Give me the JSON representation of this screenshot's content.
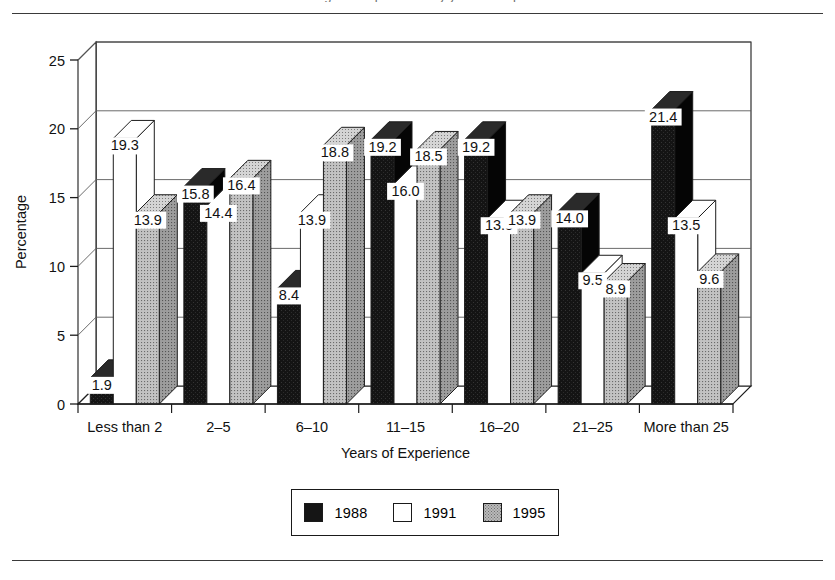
{
  "page": {
    "title_fragment": "Percentage of respondents by years of experience"
  },
  "legend": {
    "items": [
      {
        "label": "1988",
        "swatch": "black-swatch"
      },
      {
        "label": "1991",
        "swatch": "white-swatch"
      },
      {
        "label": "1995",
        "swatch": "stippled-gray-swatch"
      }
    ]
  },
  "chart_data": {
    "type": "bar",
    "title": "",
    "xlabel": "Years of Experience",
    "ylabel": "Percentage",
    "ylim": [
      0,
      25
    ],
    "yticks": [
      0,
      5,
      10,
      15,
      20,
      25
    ],
    "grid": true,
    "legend_position": "bottom",
    "three_d": true,
    "categories": [
      "Less than 2",
      "2–5",
      "6–10",
      "11–15",
      "16–20",
      "21–25",
      "More than 25"
    ],
    "series": [
      {
        "name": "1988",
        "color": "#151515",
        "values": [
          1.9,
          15.8,
          8.4,
          19.2,
          19.2,
          14.0,
          21.4
        ],
        "labels": [
          "1.9",
          "15.8",
          "8.4",
          "19.2",
          "19.2",
          "14.0",
          "21.4"
        ]
      },
      {
        "name": "1991",
        "color": "#ffffff",
        "values": [
          19.3,
          14.4,
          13.9,
          16.0,
          13.5,
          9.5,
          13.5
        ],
        "labels": [
          "19.3",
          "14.4",
          "13.9",
          "16.0",
          "13.5",
          "9.5",
          "13.5"
        ]
      },
      {
        "name": "1995",
        "color": "#b9b9b9",
        "values": [
          13.9,
          16.4,
          18.8,
          18.5,
          13.9,
          8.9,
          9.6
        ],
        "labels": [
          "13.9",
          "16.4",
          "18.8",
          "18.5",
          "13.9",
          "8.9",
          "9.6"
        ]
      }
    ]
  }
}
